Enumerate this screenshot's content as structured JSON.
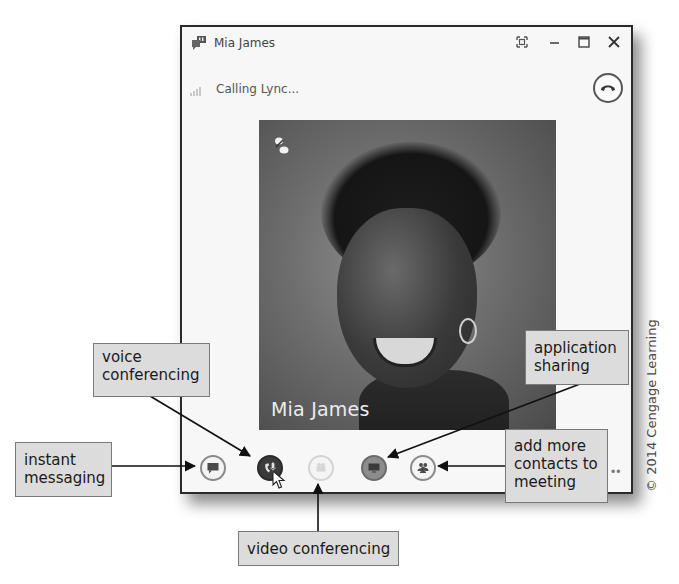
{
  "window": {
    "title": "Mia James",
    "title_buttons": [
      {
        "name": "full-screen",
        "icon": "fullscreen-icon"
      },
      {
        "name": "minimize",
        "icon": "minimize-icon"
      },
      {
        "name": "maximize",
        "icon": "maximize-icon"
      },
      {
        "name": "close",
        "icon": "close-icon"
      }
    ],
    "status": "Calling Lync...",
    "hangup_icon": "hang-up-icon",
    "contact_photo": {
      "caption": "Mia James"
    },
    "controls": [
      {
        "name": "instant-messaging",
        "icon": "im-bubble-icon",
        "state": "available"
      },
      {
        "name": "voice",
        "icon": "phone-mic-icon",
        "state": "active"
      },
      {
        "name": "video",
        "icon": "video-camera-icon",
        "state": "disabled"
      },
      {
        "name": "application-sharing",
        "icon": "monitor-icon",
        "state": "available"
      },
      {
        "name": "add-contacts",
        "icon": "people-icon",
        "state": "available"
      }
    ],
    "more_label": "••"
  },
  "callouts": {
    "voice": "voice conferencing",
    "instant": "instant messaging",
    "video": "video conferencing",
    "application": "application sharing",
    "add_contacts": "add more contacts to meeting"
  },
  "copyright": "© 2014 Cengage Learning",
  "colors": {
    "window_bg": "#f7f7f7",
    "callout_bg": "#dcdcdc",
    "active_control": "#3a3a3a"
  }
}
